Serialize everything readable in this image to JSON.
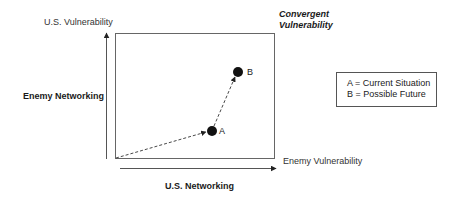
{
  "diagram": {
    "y_axis_label": "U.S. Vulnerability",
    "y_axis_side_label": "Enemy Networking",
    "x_axis_label": "Enemy Vulnerability",
    "x_axis_below_label": "U.S. Networking",
    "corner_label_line1": "Convergent",
    "corner_label_line2": "Vulnerability",
    "points": [
      {
        "id": "A",
        "label": "A",
        "cx": 212,
        "cy": 131
      },
      {
        "id": "B",
        "label": "B",
        "cx": 238,
        "cy": 72
      }
    ],
    "legend": {
      "items": [
        {
          "label": "A = Current Situation"
        },
        {
          "label": "B = Possible Future"
        }
      ]
    },
    "colors": {
      "line": "#555555",
      "point": "#111111",
      "text": "#1a1a1a"
    }
  }
}
